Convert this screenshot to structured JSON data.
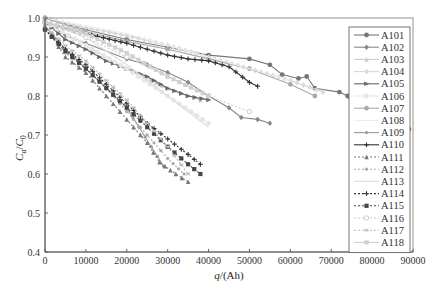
{
  "chart_data": {
    "type": "line",
    "title": "",
    "xlabel": "q/(Ah)",
    "ylabel": "Ca/C0",
    "xlim": [
      0,
      90000
    ],
    "ylim": [
      0.4,
      1.0
    ],
    "xticks": [
      0,
      10000,
      20000,
      30000,
      40000,
      50000,
      60000,
      70000,
      80000,
      90000
    ],
    "yticks": [
      0.4,
      0.5,
      0.6,
      0.7,
      0.8,
      0.9,
      1.0
    ],
    "grid": false,
    "legend_position": "right-inside",
    "series": [
      {
        "name": "A101",
        "color": "#777777",
        "dash": "",
        "marker": "circle",
        "x": [
          0,
          10000,
          20000,
          30000,
          40000,
          50000,
          55000,
          58000,
          62000,
          64000,
          66000,
          72000,
          74000,
          76000,
          80000,
          84000,
          89000
        ],
        "y": [
          1.0,
          0.97,
          0.945,
          0.925,
          0.905,
          0.895,
          0.88,
          0.855,
          0.845,
          0.85,
          0.82,
          0.81,
          0.8,
          0.76,
          0.735,
          0.73,
          0.715
        ]
      },
      {
        "name": "A102",
        "color": "#888888",
        "dash": "",
        "marker": "diamond",
        "x": [
          0,
          5000,
          10000,
          20000,
          25000,
          30000,
          35000,
          40000,
          45000,
          48000,
          52000,
          55000
        ],
        "y": [
          0.99,
          0.955,
          0.935,
          0.895,
          0.88,
          0.86,
          0.835,
          0.8,
          0.77,
          0.745,
          0.74,
          0.73
        ]
      },
      {
        "name": "A103",
        "color": "#cccccc",
        "dash": "",
        "marker": "triangle",
        "x": [
          0,
          10000,
          20000,
          30000,
          38000
        ],
        "y": [
          0.99,
          0.93,
          0.87,
          0.82,
          0.79
        ]
      },
      {
        "name": "A104",
        "color": "#d8d8d8",
        "dash": "",
        "marker": "diamond",
        "x": [
          0,
          10000,
          20000,
          30000,
          40000,
          50000,
          60000,
          68000
        ],
        "y": [
          1.0,
          0.975,
          0.955,
          0.93,
          0.9,
          0.87,
          0.84,
          0.81
        ]
      },
      {
        "name": "A105",
        "color": "#666666",
        "dash": "",
        "marker": "triangle-right",
        "x": [
          0,
          5000,
          10000,
          15000,
          20000,
          25000,
          30000,
          35000,
          40000
        ],
        "y": [
          0.99,
          0.945,
          0.92,
          0.89,
          0.87,
          0.85,
          0.82,
          0.8,
          0.79
        ]
      },
      {
        "name": "A106",
        "color": "#e6e6e6",
        "dash": "",
        "marker": "circle",
        "x": [
          0,
          10000,
          20000,
          30000,
          40000
        ],
        "y": [
          0.99,
          0.93,
          0.87,
          0.8,
          0.73
        ]
      },
      {
        "name": "A107",
        "color": "#aaaaaa",
        "dash": "",
        "marker": "circle",
        "x": [
          0,
          10000,
          20000,
          30000,
          40000,
          50000,
          60000,
          66000
        ],
        "y": [
          1.0,
          0.965,
          0.94,
          0.92,
          0.895,
          0.87,
          0.83,
          0.8
        ]
      },
      {
        "name": "A108",
        "color": "#eeeeee",
        "dash": "",
        "marker": "none",
        "x": [
          0,
          10000,
          20000,
          30000,
          40000,
          50000,
          60000
        ],
        "y": [
          1.0,
          0.98,
          0.96,
          0.93,
          0.9,
          0.87,
          0.84
        ]
      },
      {
        "name": "A109",
        "color": "#999999",
        "dash": "",
        "marker": "circle-small",
        "x": [
          0,
          5000,
          10000,
          15000,
          20000,
          23000,
          26000,
          29000
        ],
        "y": [
          0.98,
          0.92,
          0.87,
          0.82,
          0.77,
          0.72,
          0.67,
          0.62
        ]
      },
      {
        "name": "A110",
        "color": "#333333",
        "dash": "",
        "marker": "plus",
        "x": [
          3000,
          10000,
          20000,
          25000,
          30000,
          35000,
          40000,
          45000,
          50000,
          52000
        ],
        "y": [
          0.98,
          0.96,
          0.935,
          0.92,
          0.905,
          0.895,
          0.89,
          0.875,
          0.835,
          0.825
        ]
      },
      {
        "name": "A111",
        "color": "#777777",
        "dash": "2,2",
        "marker": "triangle",
        "x": [
          0,
          5000,
          10000,
          15000,
          20000,
          25000,
          28000,
          32000,
          35000
        ],
        "y": [
          0.98,
          0.9,
          0.86,
          0.8,
          0.74,
          0.68,
          0.63,
          0.6,
          0.58
        ]
      },
      {
        "name": "A112",
        "color": "#aaaaaa",
        "dash": "2,2",
        "marker": "circle-small",
        "x": [
          0,
          5000,
          10000,
          15000,
          20000,
          25000,
          30000,
          34000
        ],
        "y": [
          0.98,
          0.91,
          0.87,
          0.82,
          0.76,
          0.7,
          0.64,
          0.6
        ]
      },
      {
        "name": "A113",
        "color": "#dddddd",
        "dash": "",
        "marker": "none",
        "x": [
          0,
          10000,
          20000,
          30000,
          40000
        ],
        "y": [
          0.99,
          0.95,
          0.88,
          0.8,
          0.72
        ]
      },
      {
        "name": "A114",
        "color": "#333333",
        "dash": "2,2",
        "marker": "plus",
        "x": [
          0,
          5000,
          10000,
          15000,
          20000,
          25000,
          30000,
          35000,
          38000
        ],
        "y": [
          0.97,
          0.92,
          0.88,
          0.83,
          0.78,
          0.73,
          0.69,
          0.65,
          0.625
        ]
      },
      {
        "name": "A115",
        "color": "#444444",
        "dash": "2,2",
        "marker": "square",
        "x": [
          0,
          5000,
          10000,
          15000,
          20000,
          25000,
          30000,
          35000,
          38000
        ],
        "y": [
          0.97,
          0.915,
          0.87,
          0.82,
          0.77,
          0.72,
          0.67,
          0.625,
          0.6
        ]
      },
      {
        "name": "A116",
        "color": "#cccccc",
        "dash": "2,2",
        "marker": "circle-open",
        "x": [
          0,
          10000,
          20000,
          30000,
          40000,
          50000
        ],
        "y": [
          0.99,
          0.95,
          0.9,
          0.85,
          0.8,
          0.76
        ]
      },
      {
        "name": "A117",
        "color": "#bbbbbb",
        "dash": "2,2",
        "marker": "star",
        "x": [
          0,
          5000,
          10000,
          15000,
          20000,
          25000,
          30000,
          35000
        ],
        "y": [
          0.98,
          0.93,
          0.89,
          0.84,
          0.79,
          0.73,
          0.67,
          0.6
        ]
      },
      {
        "name": "A118",
        "color": "#d0d0d0",
        "dash": "",
        "marker": "square",
        "x": [
          0,
          10000,
          20000,
          30000,
          40000
        ],
        "y": [
          0.99,
          0.96,
          0.91,
          0.85,
          0.8
        ]
      }
    ]
  },
  "labels": {
    "ylabel_main": "C",
    "ylabel_sub_a": "a",
    "ylabel_slash": "/",
    "ylabel_sub_0": "0",
    "xlabel_q": "q",
    "xlabel_unit": "/(Ah)"
  }
}
